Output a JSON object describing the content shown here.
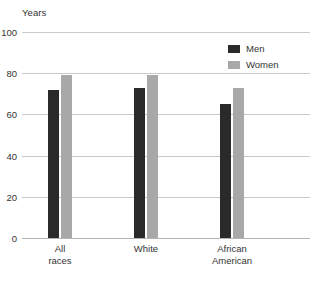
{
  "chart_data": {
    "type": "bar",
    "title": "",
    "xlabel": "",
    "ylabel": "Years",
    "categories": [
      "All races",
      "White",
      "African American"
    ],
    "category_lines": [
      [
        "All",
        "races"
      ],
      [
        "White"
      ],
      [
        "African",
        "American"
      ]
    ],
    "series": [
      {
        "name": "Men",
        "color": "#2a2a2a",
        "values": [
          72,
          73,
          65
        ]
      },
      {
        "name": "Women",
        "color": "#a8a8a8",
        "values": [
          79,
          79,
          73
        ]
      }
    ],
    "ylim": [
      0,
      100
    ],
    "yticks": [
      0,
      20,
      40,
      60,
      80,
      100
    ],
    "ytick_labels": [
      "0",
      "20",
      "40",
      "60",
      "80",
      "100"
    ],
    "grid": "horizontal",
    "legend_position": "top-right-inside",
    "gridline_color": "#c9c9c9",
    "background": "#ffffff"
  },
  "axis": {
    "y_title": "Years"
  },
  "legend": {
    "entries": [
      {
        "label": "Men"
      },
      {
        "label": "Women"
      }
    ]
  },
  "caption": {
    "text": ""
  }
}
